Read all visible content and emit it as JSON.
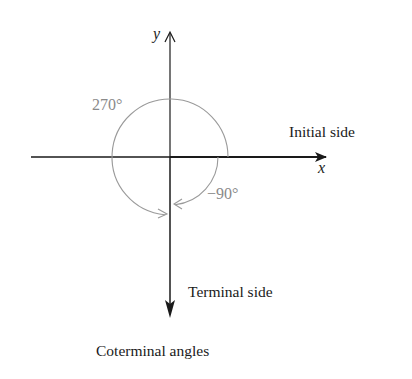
{
  "figure": {
    "caption": "Coterminal angles",
    "axes": {
      "x_label": "x",
      "y_label": "y"
    },
    "sides": {
      "initial": "Initial side",
      "terminal": "Terminal side"
    },
    "angles": [
      {
        "label": "270°",
        "direction": "counterclockwise",
        "measure_deg": 270
      },
      {
        "label": "−90°",
        "direction": "clockwise",
        "measure_deg": -90
      }
    ],
    "colors": {
      "axes": "#1a1a1a",
      "arcs": "#999999",
      "angle_labels": "#8a8a8a"
    }
  }
}
